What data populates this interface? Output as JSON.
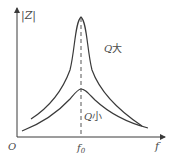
{
  "diagram": {
    "type": "resonance-curves",
    "axes": {
      "y_label": "|Z|",
      "x_label": "f",
      "origin_label": "O",
      "x_tick_label": "f",
      "x_tick_subscript": "0"
    },
    "curves": [
      {
        "name": "high-Q",
        "label_q": "Q",
        "label_cjk": "大"
      },
      {
        "name": "low-Q",
        "label_q": "Q",
        "label_cjk": "小"
      }
    ],
    "colors": {
      "line": "#3a3a3a",
      "text": "#4a4a4a",
      "dashed": "#555555"
    }
  }
}
